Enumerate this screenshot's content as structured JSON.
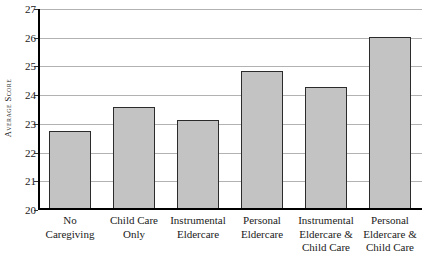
{
  "chart_data": {
    "type": "bar",
    "title": "",
    "xlabel": "",
    "ylabel": "Average Score",
    "ylim": [
      20,
      27
    ],
    "yticks": [
      20,
      21,
      22,
      23,
      24,
      25,
      26,
      27
    ],
    "ytick_labels": [
      "20",
      "21",
      "22",
      "23",
      "24",
      "25",
      "26",
      "27"
    ],
    "grid": true,
    "legend": false,
    "categories": [
      "No Caregiving",
      "Child Care Only",
      "Instrumental Eldercare",
      "Personal Eldercare",
      "Instrumental Eldercare & Child Care",
      "Personal Eldercare & Child Care"
    ],
    "category_lines": [
      [
        "No",
        "Caregiving"
      ],
      [
        "Child Care",
        "Only"
      ],
      [
        "Instrumental",
        "Eldercare"
      ],
      [
        "Personal",
        "Eldercare"
      ],
      [
        "Instrumental",
        "Eldercare &",
        "Child Care"
      ],
      [
        "Personal",
        "Eldercare &",
        "Child Care"
      ]
    ],
    "values": [
      22.72,
      23.55,
      23.1,
      24.8,
      24.25,
      26.0
    ],
    "colors": {
      "bar_fill": "#c3c3c3",
      "bar_edge": "#2b2b2b",
      "gridline": "#b2b2b2",
      "axis": "#000000",
      "text": "#1a1a1a",
      "background": "#ffffff"
    }
  }
}
